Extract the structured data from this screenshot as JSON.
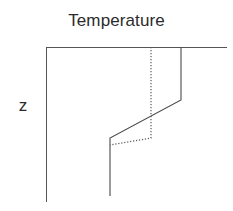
{
  "figure": {
    "width": 233,
    "height": 211,
    "background": "#ffffff"
  },
  "labels": {
    "x_axis_title": "Temperature",
    "y_axis_title": "z"
  },
  "colors": {
    "axis": "#555555",
    "solid_curve": "#4a4a4a",
    "dotted_curve": "#5a5a5a",
    "text": "#2b2b2b"
  },
  "chart_data": {
    "type": "line",
    "title": "Temperature",
    "xlabel": "Temperature",
    "ylabel": "z",
    "grid": false,
    "legend": "none",
    "axes": {
      "x_axis": {
        "orientation": "horizontal",
        "position": "top",
        "x1": 46,
        "y1": 47,
        "x2": 227,
        "y2": 47,
        "ticks": [],
        "tick_labels": []
      },
      "y_axis": {
        "orientation": "vertical",
        "position": "left",
        "x1": 46,
        "y1": 47,
        "x2": 46,
        "y2": 202,
        "ticks": [],
        "tick_labels": []
      }
    },
    "series": [
      {
        "name": "solid-profile",
        "style": "solid",
        "points": [
          {
            "x": 181,
            "y": 47
          },
          {
            "x": 181,
            "y": 100
          },
          {
            "x": 110,
            "y": 138
          },
          {
            "x": 110,
            "y": 196
          }
        ]
      },
      {
        "name": "dotted-profile",
        "style": "dotted",
        "points": [
          {
            "x": 151,
            "y": 47
          },
          {
            "x": 151,
            "y": 138
          },
          {
            "x": 110,
            "y": 145
          }
        ]
      }
    ]
  }
}
